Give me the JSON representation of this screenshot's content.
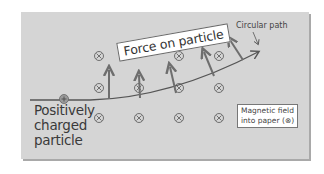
{
  "diagram": {
    "labels": {
      "force": "Force on particle",
      "path": "Circular path",
      "particle_line1": "Positively",
      "particle_line2": "charged",
      "particle_line3": "particle",
      "field_line1": "Magnetic field",
      "field_line2": "into paper (⊗)"
    },
    "symbols": {
      "field_into_page": "⊗",
      "positive_charge": "+"
    },
    "field_markers": [
      {
        "x": 99,
        "y": 56
      },
      {
        "x": 99,
        "y": 88
      },
      {
        "x": 99,
        "y": 118
      },
      {
        "x": 139,
        "y": 88
      },
      {
        "x": 139,
        "y": 118
      },
      {
        "x": 179,
        "y": 56
      },
      {
        "x": 179,
        "y": 88
      },
      {
        "x": 179,
        "y": 118
      },
      {
        "x": 219,
        "y": 56
      },
      {
        "x": 219,
        "y": 88
      },
      {
        "x": 219,
        "y": 118
      }
    ],
    "colors": {
      "panel": "#d5d5d5",
      "arrow": "#6e6e6e",
      "path": "#555555",
      "text": "#3a3a3a"
    }
  }
}
